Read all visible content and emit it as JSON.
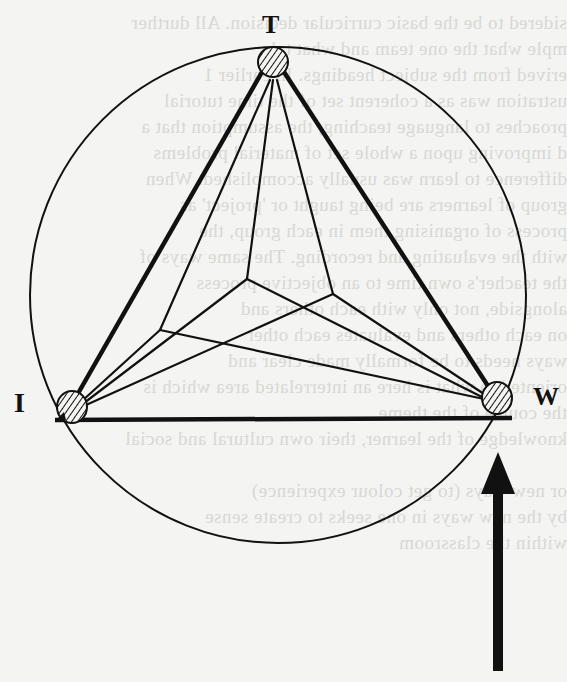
{
  "diagram": {
    "type": "triangle-in-circle",
    "nodes": [
      {
        "id": "T",
        "label": "T",
        "x": 273,
        "y": 62,
        "style": "hatched-circle"
      },
      {
        "id": "I",
        "label": "I",
        "x": 72,
        "y": 410,
        "style": "hatched-circle"
      },
      {
        "id": "W",
        "label": "W",
        "x": 497,
        "y": 398,
        "style": "hatched-circle"
      }
    ],
    "inner_junctions": [
      {
        "id": "A",
        "x": 247,
        "y": 279
      },
      {
        "id": "B",
        "x": 333,
        "y": 294
      },
      {
        "id": "C",
        "x": 160,
        "y": 330
      }
    ],
    "outer_edges": [
      [
        "T",
        "I"
      ],
      [
        "T",
        "W"
      ],
      [
        "I",
        "W"
      ]
    ],
    "inner_edges": [
      [
        "T",
        "A"
      ],
      [
        "T",
        "B"
      ],
      [
        "T",
        "C"
      ],
      [
        "A",
        "I"
      ],
      [
        "A",
        "W"
      ],
      [
        "B",
        "I"
      ],
      [
        "B",
        "W"
      ],
      [
        "C",
        "I"
      ],
      [
        "C",
        "W"
      ]
    ],
    "enclosing_circle": {
      "cx": 278,
      "cy": 295,
      "r": 248
    },
    "arrow": {
      "direction": "up",
      "x": 498,
      "tip_y": 452,
      "tail_y": 671,
      "points_to": "W"
    }
  },
  "labels": {
    "t": "T",
    "i": "I",
    "w": "W"
  },
  "background_text": [
    "sidered to be the basic curricular decision. All durther",
    "mple what the one team and what tal",
    "erived from the subject headings. In earlier 1",
    "ustration was as a coherent set of the time tutorial",
    "proaches to language teaching, the assumption that a",
    "d improving upon a whole set of material problems",
    "difference to learn was usually accomplished. When",
    "group of learners are being taught or 'project' as",
    "process of organising them in each group, the",
    "with the evaluating and recording. The same ways of",
    "the teacher's own time to an objective process",
    "alongside, not only with each others and",
    "on each others and evaluates each other",
    "ways needs to be formally made clear and",
    "oriented to what is here an interrelated area which is",
    "the course of the theme",
    "knowledge of the learner, their own cultural and social",
    "",
    "or new ways (to get colour experience)",
    "by the new ways in one seeks to create sense",
    "within the classroom"
  ]
}
